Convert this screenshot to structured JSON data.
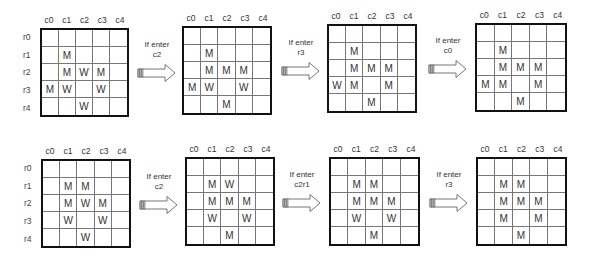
{
  "columns": [
    "c0",
    "c1",
    "c2",
    "c3",
    "c4"
  ],
  "rows": [
    "r0",
    "r1",
    "r2",
    "r3",
    "r4"
  ],
  "rows_of_grids": [
    {
      "grids": [
        {
          "cells": [
            [
              "",
              "",
              "",
              "",
              ""
            ],
            [
              "",
              "M",
              "",
              "",
              ""
            ],
            [
              "",
              "M",
              "W",
              "M",
              ""
            ],
            [
              "M",
              "W",
              "",
              "W",
              ""
            ],
            [
              "",
              "",
              "W",
              "",
              ""
            ]
          ]
        },
        {
          "cells": [
            [
              "",
              "",
              "",
              "",
              ""
            ],
            [
              "",
              "M",
              "",
              "",
              ""
            ],
            [
              "",
              "M",
              "M",
              "M",
              ""
            ],
            [
              "M",
              "W",
              "",
              "W",
              ""
            ],
            [
              "",
              "",
              "M",
              "",
              ""
            ]
          ]
        },
        {
          "cells": [
            [
              "",
              "",
              "",
              "",
              ""
            ],
            [
              "",
              "M",
              "",
              "",
              ""
            ],
            [
              "",
              "M",
              "M",
              "M",
              ""
            ],
            [
              "W",
              "M",
              "",
              "M",
              ""
            ],
            [
              "",
              "",
              "M",
              "",
              ""
            ]
          ]
        },
        {
          "cells": [
            [
              "",
              "",
              "",
              "",
              ""
            ],
            [
              "",
              "M",
              "",
              "",
              ""
            ],
            [
              "",
              "M",
              "M",
              "M",
              ""
            ],
            [
              "M",
              "M",
              "",
              "M",
              ""
            ],
            [
              "",
              "",
              "M",
              "",
              ""
            ]
          ]
        }
      ],
      "transitions": [
        {
          "line1": "If enter",
          "line2": "c2"
        },
        {
          "line1": "If enter",
          "line2": "r3"
        },
        {
          "line1": "If enter",
          "line2": "c0"
        }
      ]
    },
    {
      "grids": [
        {
          "cells": [
            [
              "",
              "",
              "",
              "",
              ""
            ],
            [
              "",
              "M",
              "M",
              "",
              ""
            ],
            [
              "",
              "M",
              "W",
              "M",
              ""
            ],
            [
              "",
              "W",
              "",
              "W",
              ""
            ],
            [
              "",
              "",
              "W",
              "",
              ""
            ]
          ]
        },
        {
          "cells": [
            [
              "",
              "",
              "",
              "",
              ""
            ],
            [
              "",
              "M",
              "W",
              "",
              ""
            ],
            [
              "",
              "M",
              "M",
              "M",
              ""
            ],
            [
              "",
              "W",
              "",
              "W",
              ""
            ],
            [
              "",
              "",
              "M",
              "",
              ""
            ]
          ]
        },
        {
          "cells": [
            [
              "",
              "",
              "",
              "",
              ""
            ],
            [
              "",
              "M",
              "M",
              "",
              ""
            ],
            [
              "",
              "M",
              "M",
              "M",
              ""
            ],
            [
              "",
              "W",
              "",
              "W",
              ""
            ],
            [
              "",
              "",
              "M",
              "",
              ""
            ]
          ]
        },
        {
          "cells": [
            [
              "",
              "",
              "",
              "",
              ""
            ],
            [
              "",
              "M",
              "M",
              "",
              ""
            ],
            [
              "",
              "M",
              "M",
              "M",
              ""
            ],
            [
              "",
              "M",
              "",
              "M",
              ""
            ],
            [
              "",
              "",
              "M",
              "",
              ""
            ]
          ]
        }
      ],
      "transitions": [
        {
          "line1": "If enter",
          "line2": "c2"
        },
        {
          "line1": "If enter",
          "line2": "c2r1"
        },
        {
          "line1": "If enter",
          "line2": "r3"
        }
      ]
    }
  ]
}
